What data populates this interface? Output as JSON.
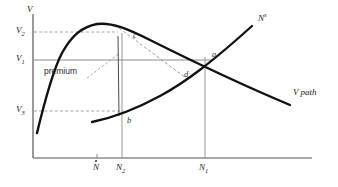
{
  "figure": {
    "axes": {
      "y_axis_label": "V",
      "x_axis_label": "",
      "origin": [
        33,
        158
      ],
      "x_axis_end": [
        312,
        158
      ],
      "y_axis_top": [
        33,
        14
      ]
    },
    "y_ticks": [
      {
        "label": "V",
        "sub": "2",
        "y": 32
      },
      {
        "label": "V",
        "sub": "1",
        "y": 60
      },
      {
        "label": "V",
        "sub": "3",
        "y": 111
      }
    ],
    "x_ticks": [
      {
        "label": "N",
        "sub": "",
        "hat": true,
        "x": 97
      },
      {
        "label": "N",
        "sub": "2",
        "hat": false,
        "x": 122
      },
      {
        "label": "N",
        "sub": "1",
        "hat": false,
        "x": 205
      }
    ],
    "curves": [
      {
        "name": "V path",
        "label": "V path",
        "label_x": 296,
        "label_y": 93
      },
      {
        "name": "labour supply",
        "label": "N",
        "superscript": "s",
        "label_x": 258,
        "label_y": 18
      }
    ],
    "points": [
      {
        "id": "a",
        "label": "a",
        "x": 212,
        "y": 55
      },
      {
        "id": "b",
        "label": "b",
        "x": 127,
        "y": 120
      },
      {
        "id": "c",
        "label": "c",
        "x": 133,
        "y": 36
      },
      {
        "id": "d",
        "label": "d",
        "x": 184,
        "y": 75
      }
    ],
    "annotations": [
      {
        "id": "premium",
        "label": "premium",
        "x": 58,
        "y": 69
      }
    ],
    "colors": {
      "ink": "#1a1a1a",
      "thin_line": "#707070",
      "dashed": "#8a8a8a",
      "background": "#ffffff"
    }
  }
}
